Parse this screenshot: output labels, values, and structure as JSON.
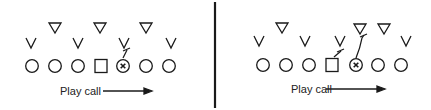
{
  "diagram": {
    "panels": [
      {
        "id": "left",
        "caption": "Play call",
        "offense": [
          {
            "type": "circle",
            "x": 32,
            "y": 66
          },
          {
            "type": "circle",
            "x": 55,
            "y": 66
          },
          {
            "type": "circle",
            "x": 78,
            "y": 66
          },
          {
            "type": "square",
            "x": 101,
            "y": 66
          },
          {
            "type": "x-circle",
            "x": 123,
            "y": 66
          },
          {
            "type": "circle",
            "x": 146,
            "y": 66
          },
          {
            "type": "circle",
            "x": 169,
            "y": 66
          }
        ],
        "linemen_v": [
          {
            "x": 31,
            "y": 44
          },
          {
            "x": 78,
            "y": 44
          },
          {
            "x": 124,
            "y": 44
          },
          {
            "x": 171,
            "y": 44
          }
        ],
        "linebackers_triangle": [
          {
            "x": 55,
            "y": 28
          },
          {
            "x": 100,
            "y": 28
          },
          {
            "x": 146,
            "y": 28
          }
        ],
        "block_marks": [
          {
            "from_x": 123,
            "from_y": 58,
            "to_x": 127,
            "to_y": 50,
            "style": "short-block"
          }
        ],
        "arrow": {
          "x1": 103,
          "x2": 152,
          "y": 91
        }
      },
      {
        "id": "right",
        "caption": "Play call",
        "offense": [
          {
            "type": "circle",
            "x": 263,
            "y": 65
          },
          {
            "type": "circle",
            "x": 286,
            "y": 65
          },
          {
            "type": "circle",
            "x": 309,
            "y": 65
          },
          {
            "type": "square",
            "x": 332,
            "y": 65
          },
          {
            "type": "x-circle",
            "x": 356,
            "y": 65
          },
          {
            "type": "circle",
            "x": 378,
            "y": 65
          },
          {
            "type": "circle",
            "x": 401,
            "y": 65
          }
        ],
        "linemen_v": [
          {
            "x": 259,
            "y": 42
          },
          {
            "x": 305,
            "y": 42
          },
          {
            "x": 340,
            "y": 42
          },
          {
            "x": 406,
            "y": 42
          }
        ],
        "linebackers_triangle": [
          {
            "x": 282,
            "y": 28
          },
          {
            "x": 360,
            "y": 29
          },
          {
            "x": 384,
            "y": 29
          }
        ],
        "block_marks": [
          {
            "from_x": 334,
            "from_y": 57,
            "to_x": 341,
            "to_y": 51,
            "style": "short-block"
          },
          {
            "from_x": 356,
            "from_y": 58,
            "to_x": 364,
            "to_y": 35,
            "style": "curved-block"
          }
        ],
        "arrow": {
          "x1": 326,
          "x2": 385,
          "y": 89
        }
      }
    ],
    "divider": {
      "x": 215,
      "y1": 2,
      "y2": 108
    },
    "stroke_color": "#1a1a1a"
  }
}
